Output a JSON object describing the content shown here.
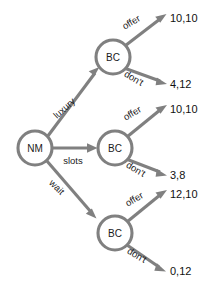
{
  "diagram": {
    "type": "extensive-form-game-tree",
    "title": "",
    "colors": {
      "edge": "#808080",
      "node_stroke": "#808080",
      "node_fill": "#ffffff",
      "text": "#1a1a1a",
      "background": "#ffffff"
    },
    "root": {
      "id": "nm-root",
      "label": "NM",
      "x": 35,
      "y": 148,
      "r": 17
    },
    "branches": [
      {
        "id": "luxury",
        "action_label": "luxury",
        "label_x": 64,
        "label_y": 108,
        "label_rotate": -42,
        "node": {
          "id": "bc-luxury",
          "label": "BC",
          "x": 113,
          "y": 57,
          "r": 17
        },
        "outcomes": [
          {
            "id": "luxury-offer",
            "action_label": "offer",
            "label_x": 131,
            "label_y": 22,
            "label_rotate": -31,
            "payoff": "10,10",
            "payoff_x": 170,
            "payoff_y": 18
          },
          {
            "id": "luxury-dont",
            "action_label": "don't",
            "label_x": 134,
            "label_y": 78,
            "label_rotate": 31,
            "payoff": "4,12",
            "payoff_x": 170,
            "payoff_y": 84
          }
        ]
      },
      {
        "id": "slots",
        "action_label": "slots",
        "label_x": 73,
        "label_y": 160,
        "label_rotate": 0,
        "node": {
          "id": "bc-slots",
          "label": "BC",
          "x": 115,
          "y": 148,
          "r": 17
        },
        "outcomes": [
          {
            "id": "slots-offer",
            "action_label": "offer",
            "label_x": 132,
            "label_y": 113,
            "label_rotate": -31,
            "payoff": "10,10",
            "payoff_x": 170,
            "payoff_y": 109
          },
          {
            "id": "slots-dont",
            "action_label": "don't",
            "label_x": 136,
            "label_y": 169,
            "label_rotate": 31,
            "payoff": "3,8",
            "payoff_x": 170,
            "payoff_y": 175
          }
        ]
      },
      {
        "id": "wait",
        "action_label": "wait",
        "label_x": 57,
        "label_y": 187,
        "label_rotate": 45,
        "node": {
          "id": "bc-wait",
          "label": "BC",
          "x": 115,
          "y": 233,
          "r": 17
        },
        "outcomes": [
          {
            "id": "wait-offer",
            "action_label": "offer",
            "label_x": 134,
            "label_y": 199,
            "label_rotate": -31,
            "payoff": "12,10",
            "payoff_x": 170,
            "payoff_y": 194
          },
          {
            "id": "wait-dont",
            "action_label": "don't",
            "label_x": 137,
            "label_y": 255,
            "label_rotate": 31,
            "payoff": "0,12",
            "payoff_x": 170,
            "payoff_y": 271
          }
        ]
      }
    ]
  }
}
